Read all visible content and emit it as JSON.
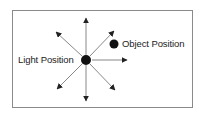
{
  "diagram": {
    "labels": {
      "light": "Light Position",
      "object": "Object Position"
    },
    "colors": {
      "dot": "#111111",
      "arrow": "#222222",
      "line": "#888888",
      "border": "#8a8a8a"
    },
    "light_position": {
      "x": 86,
      "y": 60
    },
    "object_position": {
      "x": 114,
      "y": 44
    },
    "arrows": [
      {
        "direction": "up",
        "tip": [
          86,
          18
        ]
      },
      {
        "direction": "down",
        "tip": [
          86,
          101
        ]
      },
      {
        "direction": "right",
        "tip": [
          127,
          60
        ]
      },
      {
        "direction": "up-left",
        "tip": [
          56,
          32
        ]
      },
      {
        "direction": "up-right",
        "tip": [
          114,
          31
        ]
      },
      {
        "direction": "down-left",
        "tip": [
          57,
          89
        ]
      },
      {
        "direction": "down-right",
        "tip": [
          115,
          90
        ]
      }
    ]
  }
}
